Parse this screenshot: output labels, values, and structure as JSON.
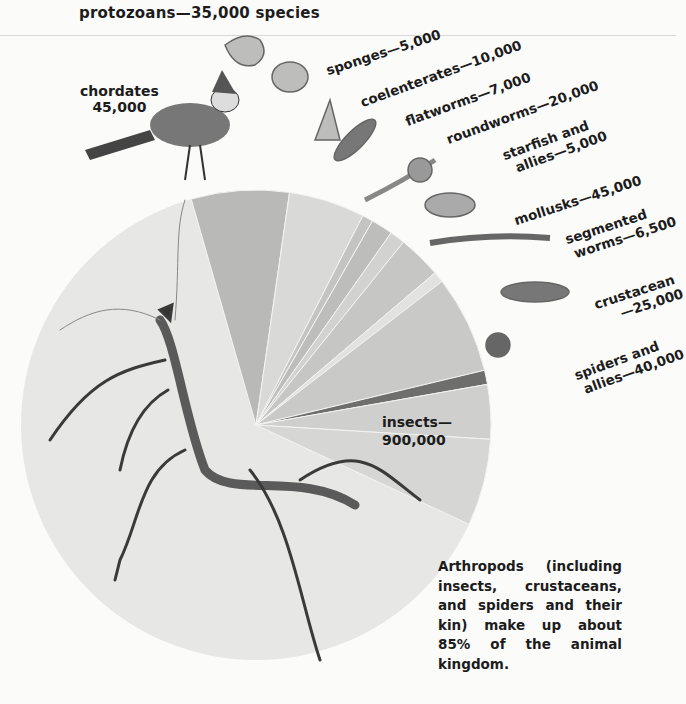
{
  "title": "protozoans—35,000 species",
  "caption": "Arthropods (including insects, crustaceans, and spiders and their kin) make up about 85% of the animal kingdom.",
  "labels": {
    "chordates": [
      "chordates",
      "45,000"
    ],
    "sponges": "sponges—5,000",
    "coelenterates": "coelenterates—10,000",
    "flatworms": "flatworms—7,000",
    "roundworms": "roundworms—20,000",
    "starfish": [
      "starfish and",
      "allies—5,000"
    ],
    "mollusks": "mollusks—45,000",
    "segmented": [
      "segmented",
      "worms—6,500"
    ],
    "crustaceans": [
      "crustacean",
      "—25,000"
    ],
    "spiders": [
      "spiders and",
      "allies—40,000"
    ],
    "insects": [
      "insects—",
      "900,000"
    ]
  },
  "chart_data": {
    "type": "pie",
    "title": "protozoans—35,000 species",
    "unit": "species",
    "categories": [
      "chordates",
      "protozoans",
      "sponges",
      "coelenterates",
      "flatworms",
      "roundworms",
      "starfish and allies",
      "mollusks",
      "segmented worms",
      "crustaceans",
      "spiders and allies",
      "insects"
    ],
    "values": [
      45000,
      35000,
      5000,
      10000,
      7000,
      20000,
      5000,
      45000,
      6500,
      25000,
      40000,
      900000
    ],
    "colors": [
      "#b9b9b7",
      "#d9d9d7",
      "#c4c4c2",
      "#bdbdbb",
      "#d2d2d0",
      "#c6c6c4",
      "#e2e2e0",
      "#c9c9c7",
      "#6e6e6c",
      "#cfcfcd",
      "#d6d6d4",
      "#e7e7e5"
    ],
    "annotation": "Arthropods (including insects, crustaceans, and spiders and their kin) make up about 85% of the animal kingdom.",
    "legend": "labels placed around pie with illustrations"
  }
}
